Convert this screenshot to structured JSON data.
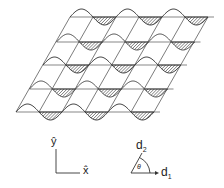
{
  "figure": {
    "rows": 5,
    "periods_per_row": 3,
    "colors": {
      "line": "#333333",
      "hatch": "#555555",
      "background": "#ffffff"
    }
  },
  "axes": {
    "x_label": "x̂",
    "y_label": "ŷ"
  },
  "lattice_vectors": {
    "d1_label": "d",
    "d1_sub": "1",
    "d2_label": "d",
    "d2_sub": "2",
    "angle_label": "θ"
  }
}
